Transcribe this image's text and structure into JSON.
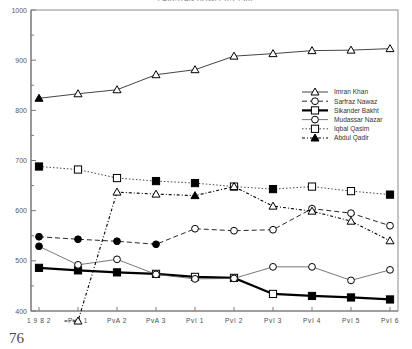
{
  "page": {
    "number": "76",
    "title": "PAKISTAN BOWLERS 1982"
  },
  "chart_data": {
    "type": "line",
    "title": "PAKISTAN BOWLERS 1982",
    "xlabel": "",
    "ylabel": "",
    "ylim": [
      400,
      1000
    ],
    "ytick_step": 100,
    "yminor_step": 50,
    "grid": false,
    "legend_position": "right-upper",
    "categories": [
      "1 9 8 2",
      "PvA 1",
      "PvA 2",
      "PvA 3",
      "PvI 1",
      "PvI 2",
      "PvI 3",
      "PvI 4",
      "PvI 5",
      "PvI 6"
    ],
    "ytick_labels": [
      "400",
      "500",
      "600",
      "700",
      "800",
      "900",
      "1000"
    ],
    "series": [
      {
        "name": "Imran Khan",
        "marker": "triangle",
        "line": "solid",
        "values": [
          824,
          833,
          841,
          871,
          881,
          908,
          913,
          919,
          920,
          923
        ],
        "filled_first": true
      },
      {
        "name": "Sarfraz Nawaz",
        "marker": "circle",
        "line": "dashed",
        "values": [
          548,
          543,
          539,
          533,
          564,
          560,
          562,
          604,
          595,
          570
        ],
        "filled_first": true
      },
      {
        "name": "Sikander Bakht",
        "marker": "square",
        "line": "solid-thick",
        "values": [
          486,
          481,
          477,
          474,
          468,
          466,
          434,
          430,
          427,
          423
        ],
        "filled_first": true
      },
      {
        "name": "Mudassar Nazar",
        "marker": "circle-open",
        "line": "thin",
        "values": [
          529,
          492,
          503,
          473,
          464,
          465,
          488,
          488,
          461,
          482
        ],
        "filled_first": true
      },
      {
        "name": "Iqbal Qasim",
        "marker": "square-open",
        "line": "dotted",
        "values": [
          688,
          682,
          665,
          659,
          655,
          648,
          643,
          648,
          639,
          632
        ],
        "filled_first": true
      },
      {
        "name": "Abdul Qadir",
        "marker": "triangle-star",
        "line": "dot-dash",
        "values": [
          null,
          380,
          637,
          633,
          630,
          648,
          609,
          599,
          579,
          540
        ],
        "filled_first": false
      }
    ]
  },
  "legend": {
    "entries": [
      {
        "label": "Imran Khan"
      },
      {
        "label": "Sarfraz Nawaz"
      },
      {
        "label": "Sikander Bakht"
      },
      {
        "label": "Mudassar Nazar"
      },
      {
        "label": "Iqbal Qasim"
      },
      {
        "label": "Abdul Qadir"
      }
    ]
  },
  "colors": {
    "axis": "#7a7a7a",
    "frame": "#8c8c8c",
    "line_default": "#2b2b2b",
    "text": "#3a3a3a"
  }
}
